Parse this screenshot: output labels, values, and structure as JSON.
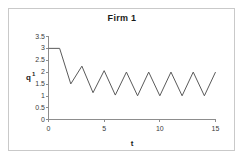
{
  "figure": {
    "frame_color": "#c9c9c9",
    "background": "#ffffff"
  },
  "chart_data": {
    "type": "line",
    "title": "Firm 1",
    "xlabel": "t",
    "ylabel": "q1",
    "ylabel_base": "q",
    "ylabel_superscript": "1",
    "x": [
      0,
      1,
      2,
      3,
      4,
      5,
      6,
      7,
      8,
      9,
      10,
      11,
      12,
      13,
      14,
      15
    ],
    "values": [
      3,
      3,
      1.5,
      2.25,
      1.13,
      2.06,
      1.03,
      2.0,
      1.0,
      2.0,
      1.0,
      2.0,
      1.0,
      2.0,
      1.0,
      2.0
    ],
    "series": [
      {
        "name": "q1",
        "color": "#5a5a5a",
        "values": [
          3,
          3,
          1.5,
          2.25,
          1.13,
          2.06,
          1.03,
          2.0,
          1.0,
          2.0,
          1.0,
          2.0,
          1.0,
          2.0,
          1.0,
          2.0
        ]
      }
    ],
    "xlim": [
      0,
      15
    ],
    "ylim": [
      0,
      3.5
    ],
    "xticks": [
      0,
      5,
      10,
      15
    ],
    "xtick_labels": [
      "0",
      "5",
      "10",
      "15"
    ],
    "yticks": [
      0,
      0.5,
      1,
      1.5,
      2,
      2.5,
      3,
      3.5
    ],
    "ytick_labels": [
      "0",
      "0.5",
      "1",
      "1.5",
      "2",
      "2.5",
      "3",
      "3.5"
    ],
    "grid": false,
    "legend": false,
    "legend_position": "none",
    "marker": "none",
    "line_color": "#5a5a5a",
    "axis_color": "#8d8d8d"
  }
}
